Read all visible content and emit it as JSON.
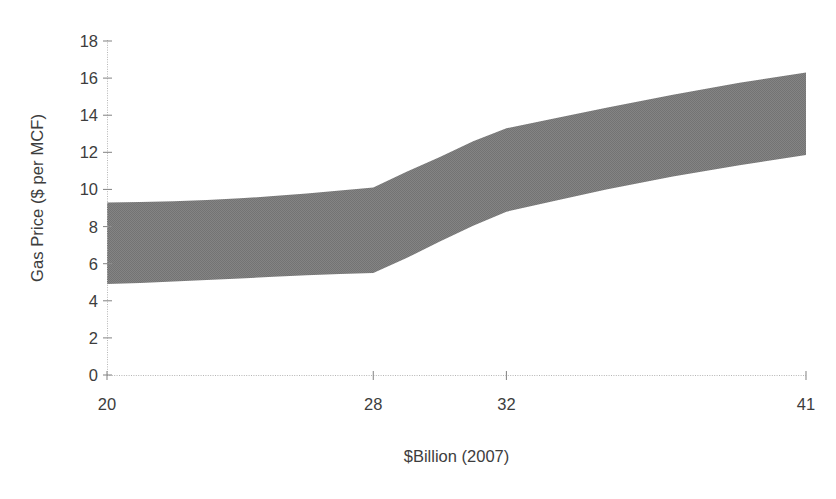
{
  "chart_data": {
    "type": "area",
    "title": "",
    "subtitle": "",
    "xlabel": "$Billion (2007)",
    "ylabel": "Gas Price ($ per MCF)",
    "x": [
      20,
      28,
      32,
      41
    ],
    "categories": [
      "20",
      "28",
      "32",
      "41"
    ],
    "xtick_labels": [
      "20",
      "28",
      "32",
      "41"
    ],
    "ytick_labels": [
      "0",
      "2",
      "4",
      "6",
      "8",
      "10",
      "12",
      "14",
      "16",
      "18"
    ],
    "yticks": [
      0,
      2,
      4,
      6,
      8,
      10,
      12,
      14,
      16,
      18
    ],
    "ylim": [
      0,
      18
    ],
    "xlim": [
      20,
      41
    ],
    "grid": false,
    "legend": null,
    "legend_position": "none",
    "band_color": "#808080",
    "axis_color": "#a6a6a6",
    "text_color": "#3d3d3d",
    "annotations": [],
    "series": [
      {
        "name": "Upper bound",
        "values": [
          9.3,
          10.1,
          13.3,
          16.3
        ]
      },
      {
        "name": "Lower bound",
        "values": [
          4.9,
          5.5,
          8.8,
          11.85
        ]
      }
    ],
    "band": {
      "description": "Shaded range between lower and upper gas price bounds",
      "upper_dense": [
        [
          20.0,
          9.3
        ],
        [
          21.0,
          9.32
        ],
        [
          22.0,
          9.36
        ],
        [
          23.0,
          9.43
        ],
        [
          24.0,
          9.52
        ],
        [
          25.0,
          9.64
        ],
        [
          26.0,
          9.78
        ],
        [
          27.0,
          9.94
        ],
        [
          28.0,
          10.1
        ],
        [
          29.0,
          10.95
        ],
        [
          30.0,
          11.75
        ],
        [
          31.0,
          12.6
        ],
        [
          32.0,
          13.3
        ],
        [
          33.5,
          13.85
        ],
        [
          35.0,
          14.4
        ],
        [
          37.0,
          15.1
        ],
        [
          39.0,
          15.75
        ],
        [
          41.0,
          16.3
        ]
      ],
      "lower_dense": [
        [
          20.0,
          4.9
        ],
        [
          21.0,
          4.96
        ],
        [
          22.0,
          5.04
        ],
        [
          23.0,
          5.12
        ],
        [
          24.0,
          5.2
        ],
        [
          25.0,
          5.29
        ],
        [
          26.0,
          5.37
        ],
        [
          27.0,
          5.44
        ],
        [
          28.0,
          5.5
        ],
        [
          29.0,
          6.3
        ],
        [
          30.0,
          7.2
        ],
        [
          31.0,
          8.05
        ],
        [
          32.0,
          8.8
        ],
        [
          33.5,
          9.4
        ],
        [
          35.0,
          10.0
        ],
        [
          37.0,
          10.7
        ],
        [
          39.0,
          11.3
        ],
        [
          41.0,
          11.85
        ]
      ]
    }
  },
  "axes": {
    "y_title": "Gas Price ($ per MCF)",
    "x_title": "$Billion (2007)"
  }
}
